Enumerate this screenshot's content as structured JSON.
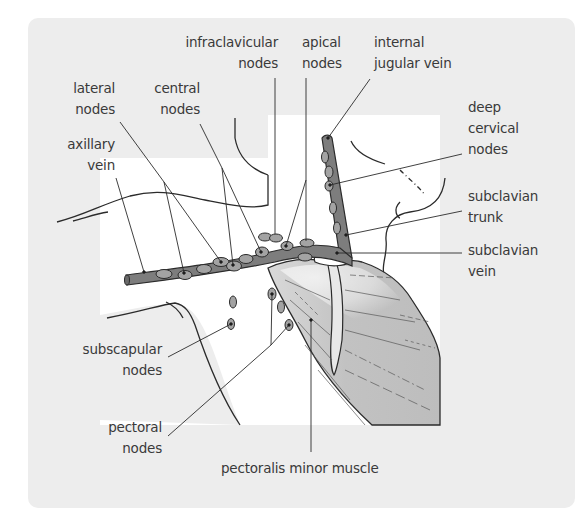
{
  "figure": {
    "type": "anatomical-diagram",
    "colors": {
      "panel_background": "#ededed",
      "drawing_area": "#ffffff",
      "vein_fill": "#7d7d7d",
      "node_fill": "#a3a3a3",
      "muscle_fill": "#c4c4c4",
      "outline": "#2b2b2b",
      "label_text": "#3a3a3a"
    }
  },
  "labels": {
    "infraclavicular_nodes": {
      "line1": "infraclavicular",
      "line2": "nodes"
    },
    "apical_nodes": {
      "line1": "apical",
      "line2": "nodes"
    },
    "internal_jugular_vein": {
      "line1": "internal",
      "line2": "jugular vein"
    },
    "lateral_nodes": {
      "line1": "lateral",
      "line2": "nodes"
    },
    "central_nodes": {
      "line1": "central",
      "line2": "nodes"
    },
    "deep_cervical_nodes": {
      "line1": "deep",
      "line2": "cervical",
      "line3": "nodes"
    },
    "axillary_vein": {
      "line1": "axillary",
      "line2": "vein"
    },
    "subclavian_trunk": {
      "line1": "subclavian",
      "line2": "trunk"
    },
    "subclavian_vein": {
      "line1": "subclavian",
      "line2": "vein"
    },
    "subscapular_nodes": {
      "line1": "subscapular",
      "line2": "nodes"
    },
    "pectoral_nodes": {
      "line1": "pectoral",
      "line2": "nodes"
    },
    "pectoralis_minor_muscle": {
      "line1": "pectoralis minor muscle"
    }
  }
}
